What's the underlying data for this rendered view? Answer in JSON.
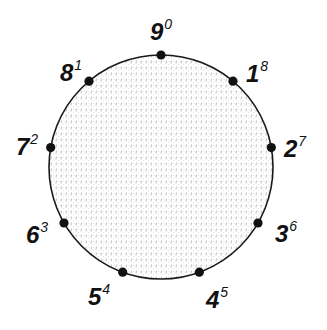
{
  "diagram": {
    "type": "circle-with-points",
    "circle": {
      "cx": 161,
      "cy": 167,
      "r": 112,
      "stroke": "#1a1a1a",
      "fill_pattern": "light-gray-stipple"
    },
    "points": [
      {
        "main": "9",
        "sup": "0",
        "angle_deg": -90,
        "label_x": 150,
        "label_y": 20
      },
      {
        "main": "1",
        "sup": "8",
        "angle_deg": -50,
        "label_x": 246,
        "label_y": 62
      },
      {
        "main": "2",
        "sup": "7",
        "angle_deg": -10,
        "label_x": 284,
        "label_y": 137
      },
      {
        "main": "3",
        "sup": "6",
        "angle_deg": 30,
        "label_x": 275,
        "label_y": 222
      },
      {
        "main": "4",
        "sup": "5",
        "angle_deg": 70,
        "label_x": 206,
        "label_y": 288
      },
      {
        "main": "5",
        "sup": "4",
        "angle_deg": 110,
        "label_x": 88,
        "label_y": 285
      },
      {
        "main": "6",
        "sup": "3",
        "angle_deg": 150,
        "label_x": 26,
        "label_y": 223
      },
      {
        "main": "7",
        "sup": "2",
        "angle_deg": 190,
        "label_x": 16,
        "label_y": 135
      },
      {
        "main": "8",
        "sup": "1",
        "angle_deg": 230,
        "label_x": 60,
        "label_y": 61
      }
    ]
  }
}
